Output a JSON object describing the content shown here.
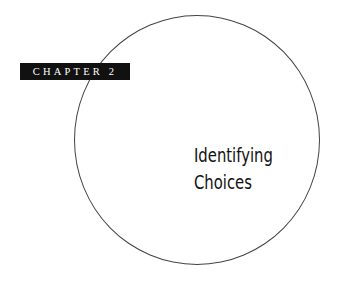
{
  "chapter": {
    "label": "CHAPTER 2"
  },
  "title": {
    "line1": "Identifying",
    "line2": "Choices"
  }
}
